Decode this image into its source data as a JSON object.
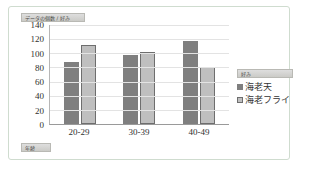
{
  "chart_data": {
    "type": "bar",
    "title": "データの個数 / 好み",
    "xlabel": "年齢",
    "ylabel": "",
    "categories": [
      "20-29",
      "30-39",
      "40-49"
    ],
    "series": [
      {
        "name": "海老天",
        "values": [
          87,
          97,
          118
        ],
        "color": "#7f7f7f"
      },
      {
        "name": "海老フライ",
        "values": [
          112,
          102,
          81
        ],
        "color": "#bfbfbf"
      }
    ],
    "ylim": [
      0,
      140
    ],
    "ytick_labels": [
      "140",
      "120",
      "100",
      "80",
      "60",
      "40",
      "20",
      "0"
    ],
    "ytick_values": [
      140,
      120,
      100,
      80,
      60,
      40,
      20,
      0
    ],
    "grid": true,
    "legend_position": "right",
    "legend_title": "好み"
  },
  "pivot": {
    "value_field_label": "データの個数 / 好み",
    "axis_field_label": "年齢",
    "legend_field_label": "好み"
  }
}
